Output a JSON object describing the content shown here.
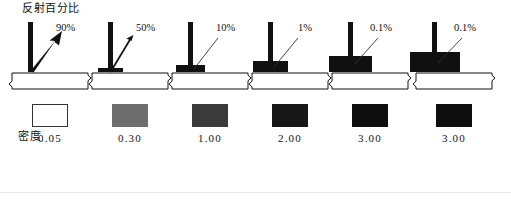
{
  "figure": {
    "axis_titles": {
      "reflectance": "反射百分比",
      "density": "密度"
    },
    "panels": [
      {
        "reflectance_label": "90%",
        "density_label": "0.05",
        "swatch_color": "#ffffff",
        "deposit_thickness": 0,
        "arrow_style": "reflected-out-thick"
      },
      {
        "reflectance_label": "50%",
        "density_label": "0.30",
        "swatch_color": "#6e6e6e",
        "deposit_thickness": 4,
        "arrow_style": "reflected-out-thin"
      },
      {
        "reflectance_label": "10%",
        "density_label": "1.00",
        "swatch_color": "#3a3a3a",
        "deposit_thickness": 7,
        "arrow_style": "pointer-line"
      },
      {
        "reflectance_label": "1%",
        "density_label": "2.00",
        "swatch_color": "#171717",
        "deposit_thickness": 11,
        "arrow_style": "pointer-line"
      },
      {
        "reflectance_label": "0.1%",
        "density_label": "3.00",
        "swatch_color": "#0e0e0e",
        "deposit_thickness": 16,
        "arrow_style": "pointer-line"
      },
      {
        "reflectance_label": "0.1%",
        "density_label": "3.00",
        "swatch_color": "#0e0e0e",
        "deposit_thickness": 20,
        "arrow_style": "pointer-line"
      }
    ]
  },
  "chart_data": {
    "type": "bar",
    "title": "反射百分比",
    "xlabel": "密度",
    "ylabel": "反射百分比",
    "categories": [
      "0.05",
      "0.30",
      "1.00",
      "2.00",
      "3.00",
      "3.00"
    ],
    "values": [
      90,
      50,
      10,
      1,
      0.1,
      0.1
    ],
    "value_labels": [
      "90%",
      "50%",
      "10%",
      "1%",
      "0.1%",
      "0.1%"
    ],
    "swatch_colors": [
      "#ffffff",
      "#6e6e6e",
      "#3a3a3a",
      "#171717",
      "#0e0e0e",
      "#0e0e0e"
    ],
    "deposit_thickness_px": [
      0,
      4,
      7,
      11,
      16,
      20
    ],
    "grid": false,
    "legend": "none"
  }
}
